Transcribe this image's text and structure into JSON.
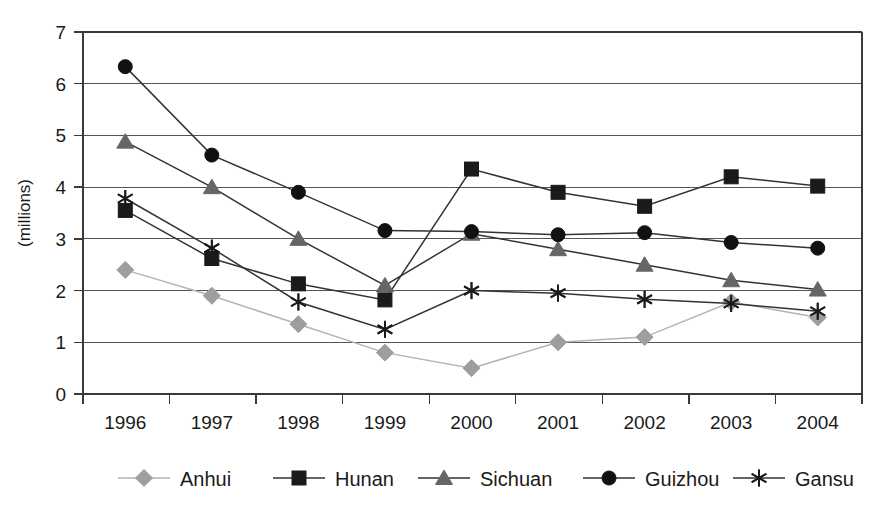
{
  "figure": {
    "title_fragment": "",
    "ylabel": "(millions)",
    "xlabel": ""
  },
  "chart_data": {
    "type": "line",
    "title": "",
    "xlabel": "",
    "ylabel": "(millions)",
    "categories": [
      "1996",
      "1997",
      "1998",
      "1999",
      "2000",
      "2001",
      "2002",
      "2003",
      "2004"
    ],
    "x": [
      1996,
      1997,
      1998,
      1999,
      2000,
      2001,
      2002,
      2003,
      2004
    ],
    "ylim": [
      0,
      7
    ],
    "yticks": [
      0,
      1,
      2,
      3,
      4,
      5,
      6,
      7
    ],
    "ytick_labels": [
      "0",
      "1",
      "2",
      "3",
      "4",
      "5",
      "6",
      "7"
    ],
    "grid": true,
    "legend_position": "bottom",
    "series": [
      {
        "name": "Anhui",
        "marker": "diamond",
        "color": "#9e9e9e",
        "line_color": "#b4b4b4",
        "values": [
          2.4,
          1.9,
          1.35,
          0.8,
          0.5,
          1.0,
          1.1,
          1.78,
          1.48
        ]
      },
      {
        "name": "Hunan",
        "marker": "square",
        "color": "#1a1a1a",
        "line_color": "#333333",
        "values": [
          3.55,
          2.62,
          2.13,
          1.82,
          4.35,
          3.9,
          3.63,
          4.2,
          4.02
        ]
      },
      {
        "name": "Sichuan",
        "marker": "triangle",
        "color": "#666666",
        "line_color": "#333333",
        "values": [
          4.88,
          4.0,
          3.0,
          2.1,
          3.1,
          2.8,
          2.5,
          2.2,
          2.02
        ]
      },
      {
        "name": "Guizhou",
        "marker": "circle",
        "color": "#111111",
        "line_color": "#333333",
        "values": [
          6.33,
          4.62,
          3.9,
          3.16,
          3.14,
          3.08,
          3.12,
          2.93,
          2.82
        ]
      },
      {
        "name": "Gansu",
        "marker": "asterisk",
        "color": "#1a1a1a",
        "line_color": "#333333",
        "values": [
          3.78,
          2.82,
          1.78,
          1.25,
          2.0,
          1.95,
          1.83,
          1.75,
          1.6
        ]
      }
    ]
  },
  "legend": {
    "items": [
      {
        "label": "Anhui"
      },
      {
        "label": "Hunan"
      },
      {
        "label": "Sichuan"
      },
      {
        "label": "Guizhou"
      },
      {
        "label": "Gansu"
      }
    ]
  }
}
